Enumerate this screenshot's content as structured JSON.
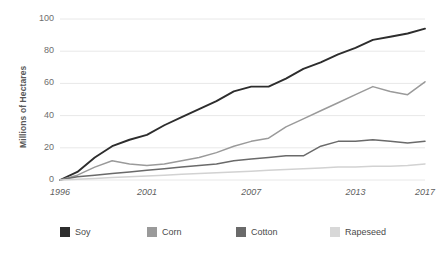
{
  "chart_data": {
    "type": "line",
    "title": "",
    "subtitle": "",
    "xlabel": "",
    "ylabel": "Millions of Hectares",
    "xlim": [
      1996,
      2017
    ],
    "ylim": [
      0,
      100
    ],
    "grid": true,
    "legend_position": "bottom",
    "x": [
      1996,
      1997,
      1998,
      1999,
      2000,
      2001,
      2002,
      2003,
      2004,
      2005,
      2006,
      2007,
      2008,
      2009,
      2010,
      2011,
      2012,
      2013,
      2014,
      2015,
      2016,
      2017
    ],
    "xticks": [
      "1996",
      "2001",
      "2007",
      "2013",
      "2017"
    ],
    "xtick_values": [
      1996,
      2001,
      2007,
      2013,
      2017
    ],
    "yticks": [
      "0",
      "20",
      "40",
      "60",
      "80",
      "100"
    ],
    "ytick_values": [
      0,
      20,
      40,
      60,
      80,
      100
    ],
    "series": [
      {
        "name": "Soy",
        "color": "#2d2d2d",
        "values": [
          0,
          5,
          14,
          21,
          25,
          28,
          34,
          39,
          44,
          49,
          55,
          58,
          58,
          63,
          69,
          73,
          78,
          82,
          87,
          89,
          91,
          94
        ]
      },
      {
        "name": "Corn",
        "color": "#9a9a9a",
        "values": [
          0,
          3,
          8,
          12,
          10,
          9,
          10,
          12,
          14,
          17,
          21,
          24,
          26,
          33,
          38,
          43,
          48,
          53,
          58,
          55,
          53,
          61
        ]
      },
      {
        "name": "Cotton",
        "color": "#6a6a6a",
        "values": [
          0,
          2,
          3,
          4,
          5,
          6,
          7,
          8,
          9,
          10,
          12,
          13,
          14,
          15,
          15,
          21,
          24,
          24,
          25,
          24,
          23,
          24
        ]
      },
      {
        "name": "Rapeseed",
        "color": "#d2d2d2",
        "values": [
          0,
          0.5,
          1,
          1.5,
          2,
          2.5,
          3,
          3.5,
          4,
          4.5,
          5,
          5.5,
          6,
          6.5,
          7,
          7.5,
          8,
          8,
          8.5,
          8.5,
          9,
          10
        ]
      }
    ]
  },
  "legend": {
    "items": [
      {
        "label": "Soy",
        "color": "#2d2d2d"
      },
      {
        "label": "Corn",
        "color": "#9a9a9a"
      },
      {
        "label": "Cotton",
        "color": "#6a6a6a"
      },
      {
        "label": "Rapeseed",
        "color": "#d8d8d8"
      }
    ]
  },
  "axes": {
    "y_title": "Millions of Hectares",
    "grid_color": "#e8e8e8",
    "tick_color": "#6e6e6e"
  }
}
